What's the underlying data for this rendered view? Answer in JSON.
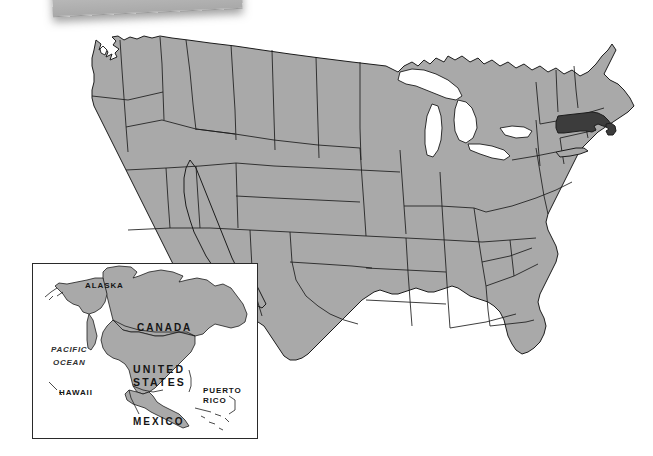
{
  "map": {
    "title": "United States locator map",
    "highlighted_state": "Massachusetts",
    "colors": {
      "land_fill": "#a9a9a9",
      "highlight_fill": "#3c3c3c",
      "water_fill": "#ffffff",
      "outline": "#1c1c1c",
      "background": "#ffffff",
      "card_gray": "#b8b8b8"
    }
  },
  "inset": {
    "name": "north-america-locator-inset",
    "labels": {
      "alaska": "ALASKA",
      "canada": "CANADA",
      "pacific_ocean_line1": "PACIFIC",
      "pacific_ocean_line2": "OCEAN",
      "united_states_line1": "UNITED",
      "united_states_line2": "STATES",
      "hawaii": "HAWAII",
      "puerto_rico_line1": "PUERTO",
      "puerto_rico_line2": "RICO",
      "mexico": "MEXICO"
    }
  }
}
